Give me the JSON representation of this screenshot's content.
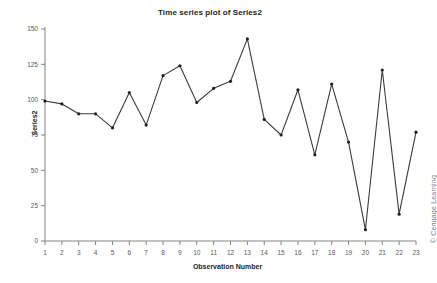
{
  "chart_data": {
    "type": "line",
    "title": "Time series plot of Series2",
    "xlabel": "Observation Number",
    "ylabel": "Series2",
    "legend": null,
    "grid": false,
    "xlim": [
      1,
      23
    ],
    "ylim": [
      0,
      150
    ],
    "xticks": [
      1,
      2,
      3,
      4,
      5,
      6,
      7,
      8,
      9,
      10,
      11,
      12,
      13,
      14,
      15,
      16,
      17,
      18,
      19,
      20,
      21,
      22,
      23
    ],
    "xtick_labels": [
      "1",
      "2",
      "3",
      "4",
      "5",
      "6",
      "7",
      "8",
      "9",
      "10",
      "11",
      "12",
      "13",
      "14",
      "15",
      "16",
      "17",
      "18",
      "19",
      "20",
      "21",
      "22",
      "23"
    ],
    "yticks": [
      0,
      25,
      50,
      75,
      100,
      125,
      150
    ],
    "ytick_labels": [
      "0",
      "25",
      "50",
      "75",
      "100",
      "125",
      "150"
    ],
    "series_name": "Series2",
    "marker": "filled-circle",
    "line_color": "#3b3b3b",
    "marker_color": "#231f20",
    "axis_color": "#808285",
    "x": [
      1,
      2,
      3,
      4,
      5,
      6,
      7,
      8,
      9,
      10,
      11,
      12,
      13,
      14,
      15,
      16,
      17,
      18,
      19,
      20,
      21,
      22,
      23
    ],
    "values": [
      99,
      97,
      90,
      90,
      80,
      105,
      82,
      117,
      124,
      98,
      108,
      113,
      143,
      86,
      75,
      107,
      61,
      111,
      70,
      8,
      121,
      19,
      77
    ]
  },
  "credit": "© Cengage Learning"
}
